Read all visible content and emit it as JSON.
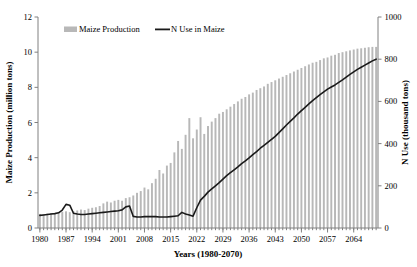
{
  "chart_data": {
    "type": "bar",
    "title": "",
    "xlabel": "Years (1980-2070)",
    "ylabel": "Maize Production (million tons)",
    "y2label": "N Use (thousand tons)",
    "xlim": [
      1980,
      2070
    ],
    "ylim": [
      0,
      12
    ],
    "y2lim": [
      0,
      1000
    ],
    "grid": false,
    "legend_position": "top-center",
    "ytick_labels": [
      "0",
      "2",
      "4",
      "6",
      "8",
      "10",
      "12"
    ],
    "yticks": [
      0,
      2,
      4,
      6,
      8,
      10,
      12
    ],
    "y2tick_labels": [
      "0",
      "200",
      "400",
      "600",
      "800",
      "1000"
    ],
    "y2ticks": [
      0,
      200,
      400,
      600,
      800,
      1000
    ],
    "xtick_labels": [
      "1980",
      "1987",
      "1994",
      "2001",
      "2008",
      "2015",
      "2022",
      "2029",
      "2036",
      "2043",
      "2050",
      "2057",
      "2064"
    ],
    "xticks": [
      1980,
      1987,
      1994,
      2001,
      2008,
      2015,
      2022,
      2029,
      2036,
      2043,
      2050,
      2057,
      2064
    ],
    "bar_color": "#b8b8b8",
    "line_color": "#1a1a1a",
    "x": [
      1980,
      1981,
      1982,
      1983,
      1984,
      1985,
      1986,
      1987,
      1988,
      1989,
      1990,
      1991,
      1992,
      1993,
      1994,
      1995,
      1996,
      1997,
      1998,
      1999,
      2000,
      2001,
      2002,
      2003,
      2004,
      2005,
      2006,
      2007,
      2008,
      2009,
      2010,
      2011,
      2012,
      2013,
      2014,
      2015,
      2016,
      2017,
      2018,
      2019,
      2020,
      2021,
      2022,
      2023,
      2024,
      2025,
      2026,
      2027,
      2028,
      2029,
      2030,
      2031,
      2032,
      2033,
      2034,
      2035,
      2036,
      2037,
      2038,
      2039,
      2040,
      2041,
      2042,
      2043,
      2044,
      2045,
      2046,
      2047,
      2048,
      2049,
      2050,
      2051,
      2052,
      2053,
      2054,
      2055,
      2056,
      2057,
      2058,
      2059,
      2060,
      2061,
      2062,
      2063,
      2064,
      2065,
      2066,
      2067,
      2068,
      2069,
      2070
    ],
    "series": [
      {
        "name": "Maize Production",
        "type": "bar",
        "axis": "left",
        "unit": "million tons",
        "values": [
          0.8,
          0.78,
          0.82,
          0.85,
          0.8,
          0.88,
          0.92,
          0.95,
          0.9,
          0.95,
          1.0,
          1.05,
          1.02,
          1.1,
          1.15,
          1.18,
          1.25,
          1.4,
          1.5,
          1.45,
          1.55,
          1.6,
          1.55,
          1.7,
          1.75,
          1.85,
          2.0,
          2.1,
          2.3,
          2.2,
          2.55,
          2.8,
          3.3,
          3.1,
          3.55,
          3.7,
          4.3,
          4.95,
          4.5,
          5.3,
          6.25,
          5.1,
          5.6,
          6.3,
          5.35,
          5.8,
          6.05,
          6.25,
          6.5,
          6.6,
          6.75,
          6.9,
          7.05,
          7.2,
          7.35,
          7.45,
          7.6,
          7.7,
          7.85,
          7.95,
          8.05,
          8.2,
          8.3,
          8.4,
          8.5,
          8.6,
          8.7,
          8.8,
          8.9,
          9.0,
          9.1,
          9.2,
          9.3,
          9.4,
          9.45,
          9.55,
          9.65,
          9.7,
          9.8,
          9.85,
          9.95,
          10.0,
          10.05,
          10.1,
          10.15,
          10.2,
          10.22,
          10.25,
          10.28,
          10.3,
          10.3
        ]
      },
      {
        "name": "N Use in Maize",
        "type": "line",
        "axis": "right",
        "unit": "thousand tons",
        "values": [
          60,
          62,
          64,
          66,
          68,
          72,
          85,
          112,
          108,
          70,
          66,
          64,
          64,
          66,
          68,
          70,
          72,
          74,
          76,
          78,
          80,
          82,
          86,
          100,
          104,
          55,
          52,
          52,
          54,
          54,
          54,
          54,
          52,
          52,
          52,
          54,
          56,
          58,
          74,
          66,
          62,
          56,
          96,
          132,
          150,
          170,
          185,
          200,
          215,
          232,
          248,
          262,
          276,
          290,
          305,
          318,
          332,
          348,
          362,
          378,
          392,
          406,
          420,
          434,
          452,
          470,
          488,
          505,
          522,
          540,
          556,
          572,
          588,
          604,
          618,
          632,
          645,
          658,
          668,
          678,
          690,
          702,
          715,
          728,
          740,
          752,
          762,
          772,
          782,
          792,
          800
        ]
      }
    ]
  },
  "legend": {
    "items": [
      {
        "label": "Maize Production",
        "marker": "bar-swatch"
      },
      {
        "label": "N Use in Maize",
        "marker": "line-swatch"
      }
    ]
  }
}
